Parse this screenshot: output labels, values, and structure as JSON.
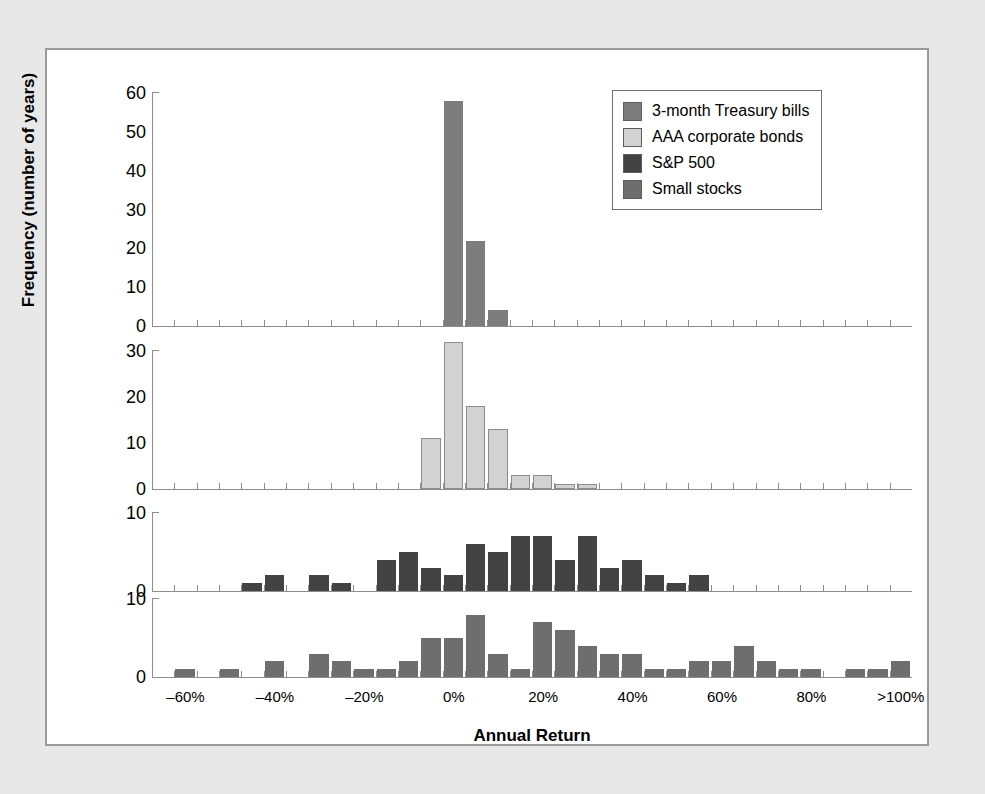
{
  "figure": {
    "xlabel": "Annual Return",
    "ylabel": "Frequency (number of years)"
  },
  "legend": {
    "items": [
      {
        "label": "3-month Treasury bills",
        "color": "#7d7d7d"
      },
      {
        "label": "AAA corporate bonds",
        "color": "#d2d2d2"
      },
      {
        "label": "S&P 500",
        "color": "#434343"
      },
      {
        "label": "Small stocks",
        "color": "#6e6e6e"
      }
    ]
  },
  "chart_data": {
    "type": "bar",
    "title": "",
    "xlabel": "Annual Return",
    "ylabel": "Frequency (number of years)",
    "xlim": [
      -65,
      105
    ],
    "bin_width": 5,
    "grid": false,
    "legend_position": "top-right",
    "xticks": [
      -60,
      -40,
      -20,
      0,
      20,
      40,
      60,
      80,
      100
    ],
    "xtick_labels": [
      "–60%",
      "–40%",
      "–20%",
      "0%",
      "20%",
      "40%",
      "60%",
      "80%",
      ">100%"
    ],
    "panels": [
      {
        "name": "3-month Treasury bills",
        "color": "#7d7d7d",
        "ylim": [
          0,
          60
        ],
        "yticks": [
          0,
          10,
          20,
          30,
          40,
          50,
          60
        ],
        "bins": [
          {
            "x": 0,
            "value": 58
          },
          {
            "x": 5,
            "value": 22
          },
          {
            "x": 10,
            "value": 4
          }
        ]
      },
      {
        "name": "AAA corporate bonds",
        "color": "#d2d2d2",
        "ylim": [
          0,
          30
        ],
        "yticks": [
          0,
          10,
          20,
          30
        ],
        "bins": [
          {
            "x": -5,
            "value": 11
          },
          {
            "x": 0,
            "value": 32
          },
          {
            "x": 5,
            "value": 18
          },
          {
            "x": 10,
            "value": 13
          },
          {
            "x": 15,
            "value": 3
          },
          {
            "x": 20,
            "value": 3
          },
          {
            "x": 25,
            "value": 1
          },
          {
            "x": 30,
            "value": 1
          }
        ]
      },
      {
        "name": "S&P 500",
        "color": "#434343",
        "ylim": [
          0,
          10
        ],
        "yticks": [
          0,
          10
        ],
        "bins": [
          {
            "x": -45,
            "value": 1
          },
          {
            "x": -40,
            "value": 2
          },
          {
            "x": -30,
            "value": 2
          },
          {
            "x": -25,
            "value": 1
          },
          {
            "x": -15,
            "value": 4
          },
          {
            "x": -10,
            "value": 5
          },
          {
            "x": -5,
            "value": 3
          },
          {
            "x": 0,
            "value": 2
          },
          {
            "x": 5,
            "value": 6
          },
          {
            "x": 10,
            "value": 5
          },
          {
            "x": 15,
            "value": 7
          },
          {
            "x": 20,
            "value": 7
          },
          {
            "x": 25,
            "value": 4
          },
          {
            "x": 30,
            "value": 7
          },
          {
            "x": 35,
            "value": 3
          },
          {
            "x": 40,
            "value": 4
          },
          {
            "x": 45,
            "value": 2
          },
          {
            "x": 50,
            "value": 1
          },
          {
            "x": 55,
            "value": 2
          }
        ]
      },
      {
        "name": "Small stocks",
        "color": "#6e6e6e",
        "ylim": [
          0,
          10
        ],
        "yticks": [
          0,
          10
        ],
        "bins": [
          {
            "x": -60,
            "value": 1
          },
          {
            "x": -50,
            "value": 1
          },
          {
            "x": -40,
            "value": 2
          },
          {
            "x": -30,
            "value": 3
          },
          {
            "x": -25,
            "value": 2
          },
          {
            "x": -20,
            "value": 1
          },
          {
            "x": -15,
            "value": 1
          },
          {
            "x": -10,
            "value": 2
          },
          {
            "x": -5,
            "value": 5
          },
          {
            "x": 0,
            "value": 5
          },
          {
            "x": 5,
            "value": 8
          },
          {
            "x": 10,
            "value": 3
          },
          {
            "x": 15,
            "value": 1
          },
          {
            "x": 20,
            "value": 7
          },
          {
            "x": 25,
            "value": 6
          },
          {
            "x": 30,
            "value": 4
          },
          {
            "x": 35,
            "value": 3
          },
          {
            "x": 40,
            "value": 3
          },
          {
            "x": 45,
            "value": 1
          },
          {
            "x": 50,
            "value": 1
          },
          {
            "x": 55,
            "value": 2
          },
          {
            "x": 60,
            "value": 2
          },
          {
            "x": 65,
            "value": 4
          },
          {
            "x": 70,
            "value": 2
          },
          {
            "x": 75,
            "value": 1
          },
          {
            "x": 80,
            "value": 1
          },
          {
            "x": 90,
            "value": 1
          },
          {
            "x": 95,
            "value": 1
          },
          {
            "x": 100,
            "value": 2
          }
        ]
      }
    ]
  }
}
